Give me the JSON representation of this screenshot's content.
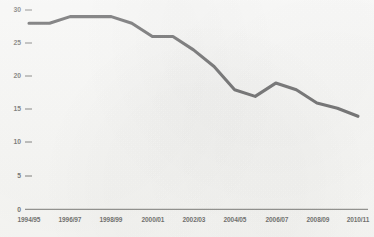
{
  "chart_data": {
    "type": "line",
    "title": "",
    "subtitle": "",
    "xlabel": "",
    "ylabel": "",
    "ylim": [
      0,
      30
    ],
    "xlim_categories": [
      "1994/95",
      "2010/11"
    ],
    "grid": false,
    "legend": "none",
    "y_ticks": [
      "0",
      "5",
      "10",
      "15",
      "20",
      "25",
      "30"
    ],
    "y_tick_values": [
      0,
      5,
      10,
      15,
      20,
      25,
      30
    ],
    "x_tick_labels": [
      "1994/95",
      "1996/97",
      "1998/99",
      "2000/01",
      "2002/03",
      "2004/05",
      "2006/07",
      "2008/09",
      "2010/11"
    ],
    "categories": [
      "1994/95",
      "1995/96",
      "1996/97",
      "1997/98",
      "1998/99",
      "1999/00",
      "2000/01",
      "2001/02",
      "2002/03",
      "2003/04",
      "2004/05",
      "2005/06",
      "2006/07",
      "2007/08",
      "2008/09",
      "2009/10",
      "2010/11"
    ],
    "series": [
      {
        "name": "Series 1",
        "color": "#18181a",
        "values": [
          28.0,
          28.0,
          29.0,
          29.0,
          29.0,
          28.0,
          26.0,
          26.0,
          24.0,
          21.5,
          18.0,
          17.0,
          19.0,
          18.0,
          16.0,
          15.2,
          14.0
        ]
      }
    ],
    "line_color": "#18181a",
    "axis_color": "#23231f",
    "background_color": "#f8f8f6"
  },
  "axis": {
    "y_tick_0": "0",
    "y_tick_5": "5",
    "y_tick_10": "10",
    "y_tick_15": "15",
    "y_tick_20": "20",
    "y_tick_25": "25",
    "y_tick_30": "30",
    "x_tick_1": "1994/95",
    "x_tick_2": "1996/97",
    "x_tick_3": "1998/99",
    "x_tick_4": "2000/01",
    "x_tick_5": "2002/03",
    "x_tick_6": "2004/05",
    "x_tick_7": "2006/07",
    "x_tick_8": "2008/09",
    "x_tick_9": "2010/11"
  }
}
